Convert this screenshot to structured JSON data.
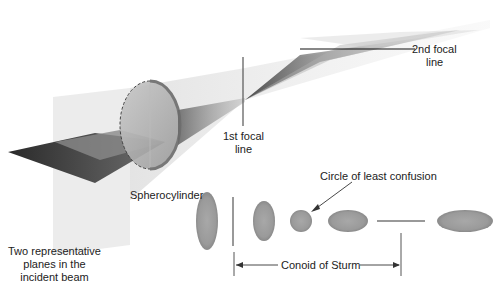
{
  "diagram": {
    "labels": {
      "second_focal_line": [
        "2nd focal",
        "line"
      ],
      "first_focal_line": [
        "1st focal",
        "line"
      ],
      "spherocylinder": "Spherocylinder",
      "circle_of_least_confusion": "Circle of least confusion",
      "conoid_of_sturm": "Conoid of Sturm",
      "incident_planes": [
        "Two representative",
        "planes in the",
        "incident beam"
      ]
    },
    "cross_sections": [
      {
        "name": "vertical-ellipse-large",
        "shape": "ellipse",
        "orientation": "vertical"
      },
      {
        "name": "first-focal-line-section",
        "shape": "line",
        "orientation": "vertical"
      },
      {
        "name": "vertical-ellipse-small",
        "shape": "ellipse",
        "orientation": "vertical"
      },
      {
        "name": "circle-of-least-confusion",
        "shape": "circle"
      },
      {
        "name": "horizontal-ellipse-small",
        "shape": "ellipse",
        "orientation": "horizontal"
      },
      {
        "name": "second-focal-line-section",
        "shape": "line",
        "orientation": "horizontal"
      },
      {
        "name": "horizontal-ellipse-large",
        "shape": "ellipse",
        "orientation": "horizontal"
      }
    ],
    "colors": {
      "section_fill": "#9a9a9a",
      "line": "#555555",
      "text": "#222222"
    }
  }
}
